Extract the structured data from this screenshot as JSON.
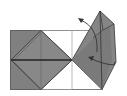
{
  "diagram": {
    "type": "origami-fold-step",
    "colors": {
      "paper_colored": "#808080",
      "paper_white": "#ffffff",
      "outline": "#555555",
      "crease": "#aaaaaa",
      "fold_line": "#222222",
      "arrow": "#333333"
    },
    "elements": [
      {
        "name": "base-rectangle",
        "desc": "square sheet outline"
      },
      {
        "name": "left-diamond-flap",
        "desc": "colored diamond on left half"
      },
      {
        "name": "right-raised-flap",
        "desc": "colored flap lifted toward upper right"
      },
      {
        "name": "unfold-arrow",
        "desc": "curved arrow pointing up-left"
      },
      {
        "name": "fold-back-arrow",
        "desc": "curved arrow pointing left into center"
      }
    ]
  }
}
